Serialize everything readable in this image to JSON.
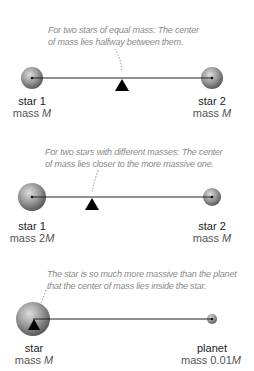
{
  "panels": [
    {
      "caption_line1": "For two stars of equal mass: The center",
      "caption_line2": "of mass lies halfway between them.",
      "left": {
        "name": "star 1",
        "mass_prefix": "mass ",
        "mass_value": "M"
      },
      "right": {
        "name": "star 2",
        "mass_prefix": "mass ",
        "mass_value": "M"
      }
    },
    {
      "caption_line1": "For two stars with different masses: The center",
      "caption_line2": "of mass lies closer to the more massive one.",
      "left": {
        "name": "star 1",
        "mass_prefix": "mass 2",
        "mass_value": "M"
      },
      "right": {
        "name": "star 2",
        "mass_prefix": "mass ",
        "mass_value": "M"
      }
    },
    {
      "caption_line1": "The star is so much more massive than the planet",
      "caption_line2": "that the center of mass lies inside the star.",
      "left": {
        "name": "star",
        "mass_prefix": "mass ",
        "mass_value": "M"
      },
      "right": {
        "name": "planet",
        "mass_prefix": "mass 0.01",
        "mass_value": "M"
      }
    }
  ],
  "colors": {
    "sphere_light": "#d0d0d0",
    "sphere_dark": "#6e6e6e",
    "line": "#222222",
    "caption": "#8a8a8a"
  }
}
